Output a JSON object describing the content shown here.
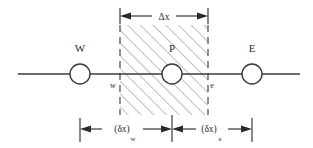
{
  "diagram": {
    "type": "finite-volume-control-volume-schematic",
    "title": "",
    "colors": {
      "line": "#3a3a3a",
      "hatch": "#8a8a8a",
      "dashed_boundary": "#4a4a4a",
      "text": "#2b2b2b",
      "background": "#ffffff",
      "node_fill": "#ffffff"
    },
    "nodes": [
      {
        "id": "W",
        "label": "W",
        "cx": 80,
        "cy": 74,
        "r": 10
      },
      {
        "id": "P",
        "label": "P",
        "cx": 172,
        "cy": 74,
        "r": 10
      },
      {
        "id": "E",
        "label": "E",
        "cx": 252,
        "cy": 74,
        "r": 10
      }
    ],
    "faces": [
      {
        "id": "w",
        "label": "w",
        "x": 113,
        "y": 88
      },
      {
        "id": "e",
        "label": "e",
        "x": 211,
        "y": 88
      }
    ],
    "dimensions": {
      "top": {
        "label": "Δx",
        "from_x": 120,
        "to_x": 208,
        "y": 16
      },
      "bottom_left": {
        "label": "(δx)",
        "subscript": "w",
        "from_x": 80,
        "to_x": 172,
        "y": 129
      },
      "bottom_right": {
        "label": "(δx)",
        "subscript": "e",
        "from_x": 172,
        "to_x": 252,
        "y": 129
      }
    },
    "control_volume": {
      "left_x": 120,
      "right_x": 208,
      "top_y": 25,
      "bottom_y": 115,
      "hatch_angle_deg": 45,
      "boundary_style": "dashed"
    },
    "axis_line": {
      "from_x": 18,
      "to_x": 300,
      "y": 74
    }
  }
}
